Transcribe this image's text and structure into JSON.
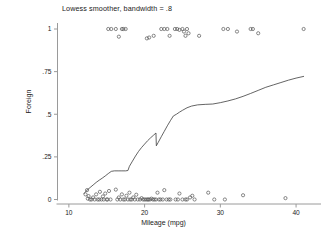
{
  "chart_data": {
    "type": "scatter",
    "title": "Lowess smoother, bandwidth = .8",
    "xlabel": "Mileage (mpg)",
    "ylabel": "Foreign",
    "xlim": [
      8.5,
      42.5
    ],
    "ylim": [
      -0.06,
      1.06
    ],
    "xticks": [
      10,
      20,
      30,
      40
    ],
    "xtick_labels": [
      "10",
      "20",
      "30",
      "40"
    ],
    "yticks": [
      0,
      0.25,
      0.5,
      0.75,
      1
    ],
    "ytick_labels": [
      "0",
      ".25",
      ".5",
      ".75",
      "1"
    ],
    "grid": false,
    "legend": "none",
    "marker": "open-circle",
    "marker_size": 1.6,
    "series": [
      {
        "name": "Foreign (observed, jittered)",
        "type": "scatter",
        "points": [
          [
            12.2,
            0.03
          ],
          [
            12.4,
            0.055
          ],
          [
            12.5,
            0.005
          ],
          [
            12.6,
            0.02
          ],
          [
            12.8,
            0.0
          ],
          [
            13.0,
            0.0
          ],
          [
            13.2,
            0.012
          ],
          [
            13.4,
            0.0
          ],
          [
            13.6,
            0.03
          ],
          [
            13.8,
            0.0
          ],
          [
            14.0,
            0.0
          ],
          [
            14.1,
            0.045
          ],
          [
            14.3,
            0.0
          ],
          [
            14.5,
            0.018
          ],
          [
            14.6,
            0.0
          ],
          [
            14.8,
            0.035
          ],
          [
            15.0,
            0.0
          ],
          [
            15.1,
            0.0
          ],
          [
            15.3,
            0.05
          ],
          [
            15.5,
            0.0
          ],
          [
            16.2,
            0.058
          ],
          [
            16.4,
            0.0
          ],
          [
            16.6,
            0.012
          ],
          [
            16.8,
            0.0
          ],
          [
            17.0,
            0.03
          ],
          [
            17.2,
            0.0
          ],
          [
            17.4,
            0.0
          ],
          [
            17.6,
            0.022
          ],
          [
            17.8,
            0.0
          ],
          [
            18.0,
            0.04
          ],
          [
            18.1,
            0.0
          ],
          [
            18.3,
            0.0
          ],
          [
            18.5,
            0.012
          ],
          [
            18.7,
            0.0
          ],
          [
            18.9,
            0.028
          ],
          [
            19.1,
            0.0
          ],
          [
            19.4,
            0.0
          ],
          [
            19.6,
            0.008
          ],
          [
            19.8,
            0.0
          ],
          [
            20.0,
            0.0
          ],
          [
            20.2,
            0.0
          ],
          [
            20.4,
            0.0
          ],
          [
            20.5,
            0.0
          ],
          [
            20.7,
            0.0
          ],
          [
            20.9,
            0.005
          ],
          [
            21.1,
            0.0
          ],
          [
            21.3,
            0.0
          ],
          [
            21.5,
            0.0
          ],
          [
            21.7,
            0.04
          ],
          [
            21.9,
            0.0
          ],
          [
            22.1,
            0.0
          ],
          [
            22.4,
            0.0
          ],
          [
            22.6,
            0.055
          ],
          [
            22.9,
            0.0
          ],
          [
            23.2,
            0.0
          ],
          [
            23.4,
            0.0
          ],
          [
            24.1,
            0.0
          ],
          [
            24.4,
            0.0
          ],
          [
            24.6,
            0.035
          ],
          [
            25.0,
            0.0
          ],
          [
            25.4,
            0.0
          ],
          [
            25.6,
            0.0
          ],
          [
            26.0,
            0.012
          ],
          [
            26.3,
            0.022
          ],
          [
            26.6,
            0.0
          ],
          [
            28.4,
            0.04
          ],
          [
            29.2,
            0.0
          ],
          [
            30.6,
            0.0
          ],
          [
            33.0,
            0.025
          ],
          [
            38.6,
            0.008
          ],
          [
            15.2,
            1.0
          ],
          [
            15.6,
            1.0
          ],
          [
            16.2,
            1.0
          ],
          [
            16.6,
            0.955
          ],
          [
            17.0,
            1.0
          ],
          [
            17.2,
            1.0
          ],
          [
            17.5,
            1.0
          ],
          [
            20.3,
            0.945
          ],
          [
            20.6,
            0.95
          ],
          [
            21.2,
            0.96
          ],
          [
            22.2,
            1.0
          ],
          [
            22.6,
            1.0
          ],
          [
            23.0,
            1.0
          ],
          [
            23.3,
            0.96
          ],
          [
            24.0,
            1.0
          ],
          [
            24.3,
            1.0
          ],
          [
            24.6,
            0.995
          ],
          [
            25.0,
            1.0
          ],
          [
            25.2,
            0.985
          ],
          [
            25.4,
            0.96
          ],
          [
            25.6,
            1.0
          ],
          [
            25.8,
            0.975
          ],
          [
            27.2,
            0.96
          ],
          [
            30.4,
            1.0
          ],
          [
            31.0,
            1.0
          ],
          [
            32.2,
            0.985
          ],
          [
            34.0,
            1.0
          ],
          [
            34.3,
            1.0
          ],
          [
            35.0,
            0.975
          ],
          [
            41.0,
            1.0
          ]
        ]
      },
      {
        "name": "Lowess smoother",
        "type": "line",
        "bandwidth": 0.8,
        "points": [
          [
            12.0,
            0.035
          ],
          [
            12.4,
            0.055
          ],
          [
            12.8,
            0.07
          ],
          [
            13.2,
            0.085
          ],
          [
            13.6,
            0.1
          ],
          [
            14.0,
            0.113
          ],
          [
            14.4,
            0.125
          ],
          [
            14.8,
            0.138
          ],
          [
            15.2,
            0.152
          ],
          [
            15.6,
            0.165
          ],
          [
            16.0,
            0.168
          ],
          [
            16.5,
            0.168
          ],
          [
            17.0,
            0.168
          ],
          [
            17.5,
            0.168
          ],
          [
            17.8,
            0.17
          ],
          [
            18.0,
            0.195
          ],
          [
            18.4,
            0.225
          ],
          [
            18.8,
            0.255
          ],
          [
            19.2,
            0.282
          ],
          [
            19.6,
            0.305
          ],
          [
            20.0,
            0.325
          ],
          [
            20.4,
            0.345
          ],
          [
            20.8,
            0.362
          ],
          [
            21.2,
            0.378
          ],
          [
            21.5,
            0.39
          ],
          [
            21.55,
            0.315
          ],
          [
            21.8,
            0.335
          ],
          [
            22.2,
            0.368
          ],
          [
            22.6,
            0.4
          ],
          [
            23.0,
            0.432
          ],
          [
            23.4,
            0.462
          ],
          [
            23.8,
            0.49
          ],
          [
            24.2,
            0.5
          ],
          [
            24.6,
            0.512
          ],
          [
            25.0,
            0.523
          ],
          [
            25.6,
            0.538
          ],
          [
            26.2,
            0.548
          ],
          [
            27.0,
            0.555
          ],
          [
            28.0,
            0.558
          ],
          [
            29.0,
            0.56
          ],
          [
            30.0,
            0.568
          ],
          [
            31.0,
            0.578
          ],
          [
            32.0,
            0.59
          ],
          [
            33.0,
            0.605
          ],
          [
            34.0,
            0.622
          ],
          [
            35.0,
            0.64
          ],
          [
            36.0,
            0.658
          ],
          [
            37.0,
            0.672
          ],
          [
            38.0,
            0.686
          ],
          [
            39.0,
            0.7
          ],
          [
            40.0,
            0.712
          ],
          [
            41.0,
            0.722
          ]
        ]
      }
    ],
    "colors": {
      "background": "#ffffff",
      "axis": "#9a9a9a",
      "marker": "#4a4a4a",
      "line": "#3c3c3c",
      "text": "#1a1a1a"
    }
  }
}
